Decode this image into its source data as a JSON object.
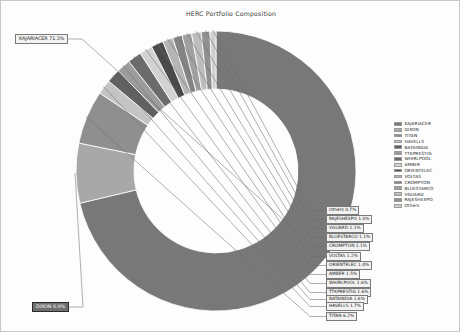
{
  "figure": {
    "background": "#fdfdfd",
    "border_color": "#c8c8c8"
  },
  "chart_data": {
    "type": "pie",
    "variant": "donut",
    "title": "HERC Portfolio Composition",
    "xlabel": "",
    "ylabel": "",
    "grid": false,
    "legend_position": "right",
    "units": "percent",
    "total": 100.0,
    "colormap": "grayscale",
    "categories": [
      "KAJARIACER",
      "DIXON",
      "TITAN",
      "HAVELLS",
      "BATAINDIA",
      "TTKPRESTIG",
      "WHIRLPOOL",
      "AMBER",
      "ORIENTELEC",
      "VOLTAS",
      "CROMPTON",
      "BLUESTARCO",
      "VGUARD",
      "RAJESHEXPO",
      "Others"
    ],
    "values": [
      71.3,
      6.9,
      6.2,
      1.7,
      1.6,
      1.6,
      1.6,
      1.5,
      1.4,
      1.2,
      1.1,
      1.1,
      1.1,
      1.0,
      0.7
    ],
    "colors": [
      "#787878",
      "#a8a8a8",
      "#8f8f8f",
      "#c4c4c4",
      "#606060",
      "#9c9c9c",
      "#6b6b6b",
      "#d2d2d2",
      "#4a4a4a",
      "#b5b5b5",
      "#848484",
      "#a0a0a0",
      "#bdbdbd",
      "#909090",
      "#cfcfcf"
    ],
    "data_labels": [
      "KAJARIACER 71.3%",
      "DIXON 6.9%",
      "TITAN 6.2%",
      "HAVELLS 1.7%",
      "BATAINDIA 1.6%",
      "TTKPRESTIG 1.6%",
      "WHIRLPOOL 1.6%",
      "AMBER 1.5%",
      "ORIENTELEC 1.4%",
      "VOLTAS 1.2%",
      "CROMPTON 1.1%",
      "BLUESTARCO 1.1%",
      "VGUARD 1.1%",
      "RAJESHEXPO 1.0%",
      "Others 0.7%"
    ],
    "selected_label": "DIXON 6.9%"
  },
  "legend": {
    "entries": [
      {
        "label": "KAJARIACER",
        "color": "#787878"
      },
      {
        "label": "DIXON",
        "color": "#a8a8a8"
      },
      {
        "label": "TITAN",
        "color": "#8f8f8f"
      },
      {
        "label": "HAVELLS",
        "color": "#c4c4c4"
      },
      {
        "label": "BATAINDIA",
        "color": "#606060"
      },
      {
        "label": "TTKPRESTIG",
        "color": "#9c9c9c"
      },
      {
        "label": "WHIRLPOOL",
        "color": "#6b6b6b"
      },
      {
        "label": "AMBER",
        "color": "#d2d2d2"
      },
      {
        "label": "ORIENTELEC",
        "color": "#4a4a4a"
      },
      {
        "label": "VOLTAS",
        "color": "#b5b5b5"
      },
      {
        "label": "CROMPTON",
        "color": "#848484"
      },
      {
        "label": "BLUESTARCO",
        "color": "#a0a0a0"
      },
      {
        "label": "VGUARD",
        "color": "#bdbdbd"
      },
      {
        "label": "RAJESHEXPO",
        "color": "#909090"
      },
      {
        "label": "Others",
        "color": "#cfcfcf"
      }
    ]
  }
}
